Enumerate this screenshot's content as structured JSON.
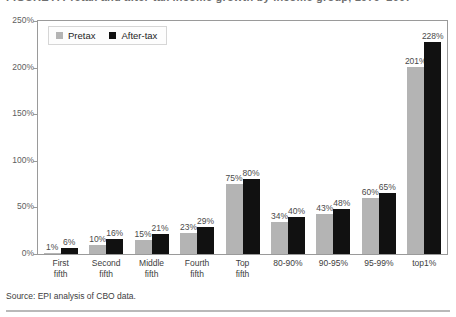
{
  "figure": {
    "title_partial": "FIGURE A  Pretax and after-tax income growth by income group, 1979–2007",
    "source_note": "Source: EPI analysis of CBO data."
  },
  "legend": {
    "position": "top-left-inside",
    "items": [
      {
        "label": "Pretax",
        "color": "#b4b4b4",
        "swatch": "square-swatch"
      },
      {
        "label": "After-tax",
        "color": "#111111",
        "swatch": "square-swatch"
      }
    ]
  },
  "axis": {
    "yticks": [
      "0%",
      "50%",
      "100%",
      "150%",
      "200%",
      "250%"
    ],
    "ytick_values": [
      0,
      50,
      100,
      150,
      200,
      250
    ]
  },
  "chart_data": {
    "type": "bar",
    "title": "Pretax and after-tax income growth by income group",
    "xlabel": "",
    "ylabel": "",
    "ylim": [
      0,
      250
    ],
    "grid": false,
    "legend_position": "top-left",
    "categories": [
      "First fifth",
      "Second fifth",
      "Middle fifth",
      "Fourth fifth",
      "Top fifth",
      "80-90%",
      "90-95%",
      "95-99%",
      "top1%"
    ],
    "category_lines": [
      [
        "First",
        "fifth"
      ],
      [
        "Second",
        "fifth"
      ],
      [
        "Middle",
        "fifth"
      ],
      [
        "Fourth",
        "fifth"
      ],
      [
        "Top",
        "fifth"
      ],
      [
        "80-90%"
      ],
      [
        "90-95%"
      ],
      [
        "95-99%"
      ],
      [
        "top1%"
      ]
    ],
    "series": [
      {
        "name": "Pretax",
        "color": "#b4b4b4",
        "values": [
          1,
          10,
          15,
          23,
          75,
          34,
          43,
          60,
          201
        ],
        "labels": [
          "1%",
          "10%",
          "15%",
          "23%",
          "75%",
          "34%",
          "43%",
          "60%",
          "201%"
        ]
      },
      {
        "name": "After-tax",
        "color": "#111111",
        "values": [
          6,
          16,
          21,
          29,
          80,
          40,
          48,
          65,
          228
        ],
        "labels": [
          "6%",
          "16%",
          "21%",
          "29%",
          "80%",
          "40%",
          "48%",
          "65%",
          "228%"
        ]
      }
    ]
  }
}
